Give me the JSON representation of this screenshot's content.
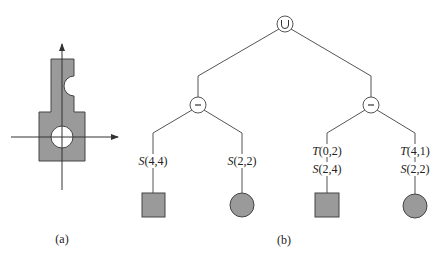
{
  "colors": {
    "fill": "#9a9a9a",
    "stroke": "#444444",
    "line": "#555555",
    "background": "#ffffff"
  },
  "figure_a": {
    "caption": "(a)",
    "description": "Gray part with a circular hole at the origin and a semicircular notch on the upper-right edge, with x/y axes"
  },
  "figure_b": {
    "caption": "(b)",
    "root": {
      "op": "∪",
      "name": "union"
    },
    "subtrees": [
      {
        "op": "−",
        "name": "difference",
        "children": [
          {
            "transforms": [
              "S(4,4)"
            ],
            "primitive": "square"
          },
          {
            "transforms": [
              "S(2,2)"
            ],
            "primitive": "circle"
          }
        ]
      },
      {
        "op": "−",
        "name": "difference",
        "children": [
          {
            "transforms": [
              "T(0,2)",
              "S(2,4)"
            ],
            "primitive": "square"
          },
          {
            "transforms": [
              "T(4,1)",
              "S(2,2)"
            ],
            "primitive": "circle"
          }
        ]
      }
    ]
  },
  "labels": {
    "l1": {
      "fn": "S",
      "args": "(4,4)"
    },
    "l2": {
      "fn": "S",
      "args": "(2,2)"
    },
    "l3a": {
      "fn": "T",
      "args": "(0,2)"
    },
    "l3b": {
      "fn": "S",
      "args": "(2,4)"
    },
    "l4a": {
      "fn": "T",
      "args": "(4,1)"
    },
    "l4b": {
      "fn": "S",
      "args": "(2,2)"
    }
  }
}
